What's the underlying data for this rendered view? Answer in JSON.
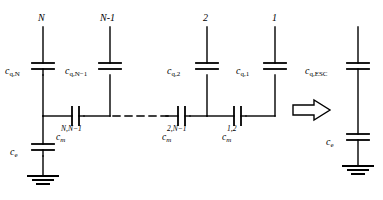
{
  "diagram": {
    "type": "circuit-schematic",
    "background_color": "#ffffff",
    "line_color": "#000000",
    "left_network": {
      "name": "distributed-capacitor-ladder",
      "node_labels": [
        "N",
        "N-1",
        "2",
        "1"
      ],
      "quantum_capacitors": [
        {
          "label_base": "c",
          "label_sub": "q,N",
          "node": "N"
        },
        {
          "label_base": "c",
          "label_sub": "q,N−1",
          "node": "N-1"
        },
        {
          "label_base": "c",
          "label_sub": "q,2",
          "node": "2"
        },
        {
          "label_base": "c",
          "label_sub": "q,1",
          "node": "1"
        }
      ],
      "mutual_capacitors": [
        {
          "label_base": "c",
          "label_sub": "m",
          "label_sup": "N,N−1"
        },
        {
          "label_base": "c",
          "label_sub": "m",
          "label_sup": "2,N−1"
        },
        {
          "label_base": "c",
          "label_sub": "m",
          "label_sup": "1,2"
        }
      ],
      "environment_capacitor": {
        "label_base": "c",
        "label_sub": "e"
      },
      "ground_symbol": "earth-ground",
      "continuation": "dashed-line"
    },
    "arrow": {
      "name": "implies-arrow",
      "direction": "right",
      "style": "hollow-block"
    },
    "right_network": {
      "name": "equivalent-series-capacitance",
      "quantum_capacitor": {
        "label_base": "c",
        "label_sub": "q,ESC"
      },
      "environment_capacitor": {
        "label_base": "c",
        "label_sub": "e"
      },
      "ground_symbol": "earth-ground"
    }
  }
}
